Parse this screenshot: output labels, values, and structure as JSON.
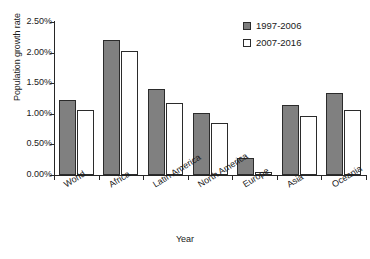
{
  "chart_data": {
    "type": "bar",
    "title": "",
    "xlabel": "Year",
    "ylabel": "Population growth rate",
    "categories": [
      "World",
      "Africa",
      "Latin America",
      "North America",
      "Europe",
      "Asia",
      "Oceania"
    ],
    "series": [
      {
        "name": "1997-2006",
        "color": "#808080",
        "values": [
          1.23,
          2.2,
          1.4,
          1.01,
          0.28,
          1.15,
          1.34
        ]
      },
      {
        "name": "2007-2016",
        "color": "#ffffff",
        "values": [
          1.07,
          2.03,
          1.17,
          0.85,
          0.05,
          0.97,
          1.06
        ]
      }
    ],
    "ylim": [
      0,
      2.5
    ],
    "ytick_values": [
      0,
      0.5,
      1.0,
      1.5,
      2.0,
      2.5
    ],
    "ytick_labels": [
      "0.00%",
      "0.50%",
      "1.00%",
      "1.50%",
      "2.00%",
      "2.50%"
    ],
    "grid": false,
    "legend_position": "top-right",
    "value_format": "percent"
  },
  "legend": {
    "entries": [
      {
        "label": "1997-2006",
        "marker": "filled-square"
      },
      {
        "label": "2007-2016",
        "marker": "open-square"
      }
    ]
  },
  "axes": {
    "y_title": "Population growth rate",
    "x_title": "Year"
  }
}
